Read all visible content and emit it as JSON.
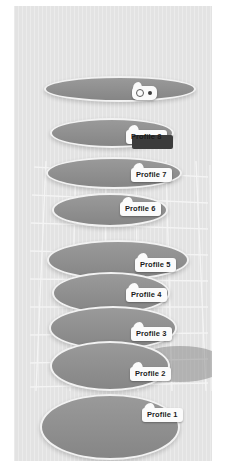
{
  "scene": {
    "background_color": "#e3e3e3",
    "page_background_color": "#ffffff",
    "ellipse_fill_color": "#8e8e8e",
    "ellipse_outline_color": "#f2f2f2",
    "grid_line_color": "#f5f5f5",
    "label_background_color": "#fbfbfb",
    "label_text_color": "#1b1b1b",
    "highlight_shadow_color": "#3b3b3b",
    "projection_color": "#6e6e6e"
  },
  "cursor": {
    "name": "pointer-balloon",
    "ring_icon": "circle-outline-icon",
    "dot_icon": "dot-icon"
  },
  "profiles": [
    {
      "id": "profile-8",
      "label": "Profile 8",
      "highlighted": false,
      "label_visible": false,
      "ellipse": {
        "left": 30,
        "top": 70,
        "width": 152,
        "height": 26
      },
      "label_pos": {
        "left": 106,
        "top": 94
      }
    },
    {
      "id": "profile-8b",
      "label": "Profile 8",
      "highlighted": true,
      "label_visible": true,
      "ellipse": {
        "left": 36,
        "top": 112,
        "width": 124,
        "height": 30
      },
      "label_pos": {
        "left": 112,
        "top": 124
      }
    },
    {
      "id": "profile-7",
      "label": "Profile 7",
      "highlighted": false,
      "label_visible": true,
      "ellipse": {
        "left": 32,
        "top": 151,
        "width": 136,
        "height": 32
      },
      "label_pos": {
        "left": 117,
        "top": 162
      }
    },
    {
      "id": "profile-6",
      "label": "Profile 6",
      "highlighted": false,
      "label_visible": true,
      "ellipse": {
        "left": 38,
        "top": 187,
        "width": 116,
        "height": 34
      },
      "label_pos": {
        "left": 106,
        "top": 196
      }
    },
    {
      "id": "profile-5",
      "label": "Profile 5",
      "highlighted": false,
      "label_visible": true,
      "ellipse": {
        "left": 33,
        "top": 234,
        "width": 142,
        "height": 40
      },
      "label_pos": {
        "left": 121,
        "top": 252
      }
    },
    {
      "id": "profile-4",
      "label": "Profile 4",
      "highlighted": false,
      "label_visible": true,
      "ellipse": {
        "left": 38,
        "top": 266,
        "width": 118,
        "height": 42
      },
      "label_pos": {
        "left": 112,
        "top": 282
      }
    },
    {
      "id": "profile-3",
      "label": "Profile 3",
      "highlighted": false,
      "label_visible": true,
      "ellipse": {
        "left": 35,
        "top": 300,
        "width": 128,
        "height": 44
      },
      "label_pos": {
        "left": 117,
        "top": 321
      }
    },
    {
      "id": "profile-2",
      "label": "Profile 2",
      "highlighted": false,
      "label_visible": true,
      "ellipse": {
        "left": 36,
        "top": 335,
        "width": 120,
        "height": 50
      },
      "label_pos": {
        "left": 116,
        "top": 361
      }
    },
    {
      "id": "profile-1",
      "label": "Profile 1",
      "highlighted": false,
      "label_visible": true,
      "ellipse": {
        "left": 26,
        "top": 388,
        "width": 140,
        "height": 66
      },
      "label_pos": {
        "left": 128,
        "top": 402
      }
    }
  ],
  "projection": {
    "name": "projected-ellipse-shadow",
    "left": 120,
    "top": 340,
    "width": 92,
    "height": 36
  },
  "grid": {
    "name": "perspective-ground-plane",
    "horizontal_line_count": 9,
    "vertical_line_count": 7
  }
}
